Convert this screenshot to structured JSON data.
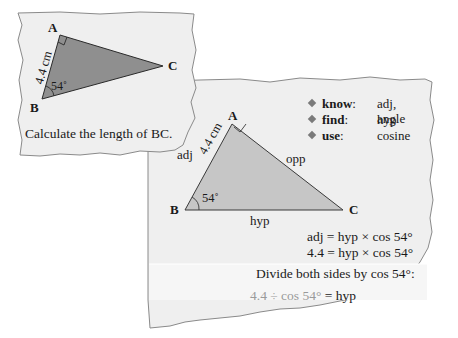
{
  "colors": {
    "panel_bg": "#efefef",
    "panel_band": "#f6f6f6",
    "panel_edge": "#8a8a8a",
    "triangle_dark": "#8f8f8f",
    "triangle_light": "#c6c6c6",
    "text": "#1a1a1a",
    "muted_text": "#9a9a9a",
    "bullet": "#7a7a7a"
  },
  "question_card": {
    "vertices": {
      "A": "A",
      "B": "B",
      "C": "C"
    },
    "side_label": "4.4 cm",
    "angle_label": "54˚",
    "prompt": "Calculate the length of BC."
  },
  "solution_card": {
    "checklist": [
      {
        "key": "know",
        "value": "adj, angle"
      },
      {
        "key": "find",
        "value": "hyp"
      },
      {
        "key": "use",
        "value": "cosine"
      }
    ],
    "vertices": {
      "A": "A",
      "B": "B",
      "C": "C"
    },
    "side_labels": {
      "adj": "adj",
      "opp": "opp",
      "hyp": "hyp",
      "length": "4.4 cm"
    },
    "angle_label": "54˚",
    "equations": [
      "adj = hyp × cos 54°",
      "4.4 = hyp × cos 54°"
    ],
    "instruction": "Divide both sides by cos 54°:",
    "result": {
      "lhs": "4.4 ÷ cos 54°",
      "rhs": " = hyp"
    }
  }
}
